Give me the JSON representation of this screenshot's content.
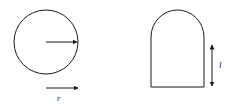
{
  "diagram": {
    "colors": {
      "stroke": "#1a1a1a",
      "background": "#ffffff"
    },
    "circle": {
      "center": [
        46,
        42
      ],
      "radius": 32,
      "radius_arrow": {
        "from": [
          46,
          42
        ],
        "to": [
          78,
          42
        ]
      }
    },
    "radius_legend": {
      "arrow": {
        "from": [
          46,
          88
        ],
        "to": [
          78,
          88
        ]
      },
      "label": "r"
    },
    "arch_shape": {
      "left": 151,
      "right": 204,
      "bottom": 87,
      "arc_start_y": 37,
      "height_arrow": {
        "x": 212,
        "from_y": 44,
        "to_y": 87
      },
      "label": "l"
    }
  }
}
